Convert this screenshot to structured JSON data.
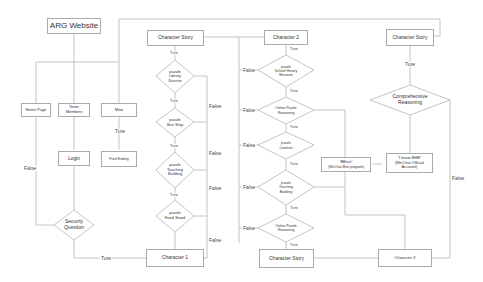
{
  "diagram": {
    "title_node": "ARG Website",
    "nav": {
      "home_page": "Home Page",
      "team_members_1": "Team",
      "team_members_2": "Members",
      "mine": "Mine",
      "login": "Login",
      "final_ending": "Final Ending",
      "security_1": "Security",
      "security_2": "Question"
    },
    "column1": {
      "story": "Character  Story",
      "p1": [
        "puzzle",
        "Library",
        "Survive"
      ],
      "p2": [
        "puzzle",
        "Bus Stop"
      ],
      "p3": [
        "puzzle",
        "Teaching",
        "Building"
      ],
      "p4": [
        "puzzle",
        "Food Stand"
      ],
      "character": "Character 1"
    },
    "column2": {
      "character": "Character 2",
      "p1": [
        "puzzle",
        "School History",
        "Museum"
      ],
      "p2": [
        "Online Puzzle",
        "Reasoning"
      ],
      "p3": [
        "puzzle",
        "Canteen"
      ],
      "p4": [
        "puzzle",
        "Teaching",
        "Building"
      ],
      "p5": [
        "Online Puzzle",
        "Reasoning"
      ],
      "story": "Character Story"
    },
    "column3": {
      "story": "Character Story",
      "reasoning": [
        "Comprehensive",
        "Reasoning"
      ],
      "wechat_mini": [
        "\"BBhue\"",
        "(WeChat Mini program)"
      ],
      "wechat_official": [
        "\"I know BHB\"",
        "(WeChat Official",
        "Account)"
      ],
      "character": "Character 3"
    },
    "labels": {
      "true": "Ture",
      "false": "False"
    }
  }
}
